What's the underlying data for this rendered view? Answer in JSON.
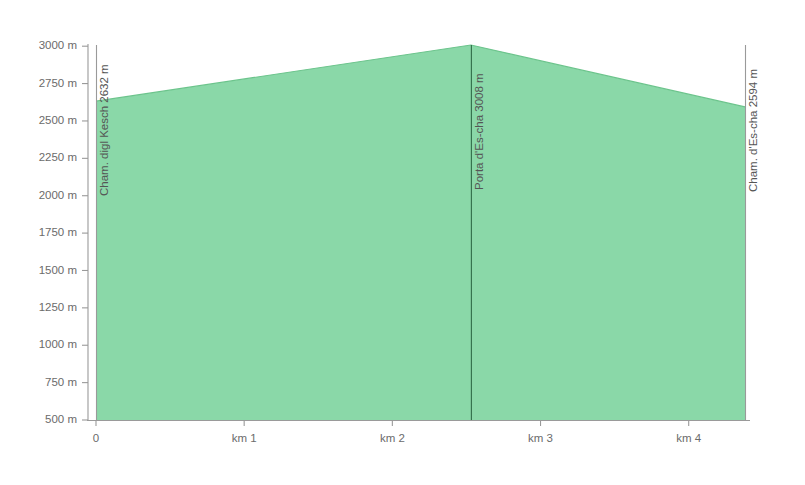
{
  "chart_data": {
    "type": "area",
    "title": "",
    "subtitle": "",
    "xlabel": "",
    "ylabel": "",
    "xlim": [
      0,
      4.38
    ],
    "ylim": [
      500,
      3050
    ],
    "grid": false,
    "legend_position": "none",
    "fill_color": "#8ad8a8",
    "line_color": "#6cc48c",
    "axis_color": "#9a9a9a",
    "waypoint_line_color": "#2f6b47",
    "x_unit": "km",
    "y_unit": "m",
    "x_ticks": [
      {
        "value": 0,
        "label": "0"
      },
      {
        "value": 1,
        "label": "km 1"
      },
      {
        "value": 2,
        "label": "km 2"
      },
      {
        "value": 3,
        "label": "km 3"
      },
      {
        "value": 4,
        "label": "km 4"
      }
    ],
    "y_ticks": [
      {
        "value": 3000,
        "label": "3000 m"
      },
      {
        "value": 2750,
        "label": "2750 m"
      },
      {
        "value": 2500,
        "label": "2500 m"
      },
      {
        "value": 2250,
        "label": "2250 m"
      },
      {
        "value": 2000,
        "label": "2000 m"
      },
      {
        "value": 1750,
        "label": "1750 m"
      },
      {
        "value": 1500,
        "label": "1500 m"
      },
      {
        "value": 1250,
        "label": "1250 m"
      },
      {
        "value": 1000,
        "label": "1000 m"
      },
      {
        "value": 750,
        "label": "750 m"
      },
      {
        "value": 500,
        "label": "500 m"
      }
    ],
    "x": [
      0,
      2.53,
      4.38
    ],
    "values": [
      2632,
      3008,
      2594
    ],
    "series": [
      {
        "name": "elevation",
        "values": [
          2632,
          3008,
          2594
        ]
      }
    ],
    "waypoints": [
      {
        "name": "Cham. digl Kesch",
        "elevation": 2632,
        "label": "Cham. digl Kesch  2632 m",
        "distance_km": 0,
        "line_style": "boundary"
      },
      {
        "name": "Porta d'Es-cha",
        "elevation": 3008,
        "label": "Porta d'Es-cha  3008 m",
        "distance_km": 2.53,
        "line_style": "interior"
      },
      {
        "name": "Cham. d'Es-cha",
        "elevation": 2594,
        "label": "Cham. d'Es-cha  2594 m",
        "distance_km": 4.38,
        "line_style": "boundary"
      }
    ]
  }
}
